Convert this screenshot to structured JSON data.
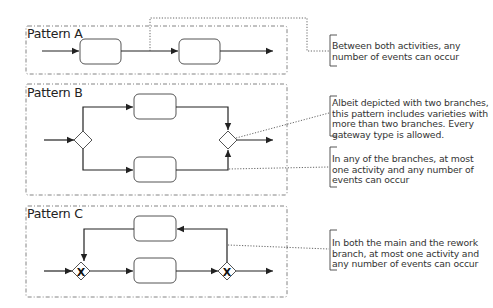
{
  "diagram": {
    "patterns": [
      {
        "label": "Pattern A",
        "elements": [
          "start-flow",
          "activity",
          "activity",
          "end-flow"
        ],
        "annotation": "Between both activities, any number of events can occur"
      },
      {
        "label": "Pattern B",
        "elements": [
          "start-flow",
          "split-gateway",
          "activity-upper",
          "activity-lower",
          "join-gateway",
          "end-flow"
        ],
        "annotations": [
          "Albeit depicted with two branches, this pattern includes varieties with more than two branches. Every gateway type is allowed.",
          "In any of the branches, at most one activity and any number of events can occur"
        ]
      },
      {
        "label": "Pattern C",
        "elements": [
          "start-flow",
          "xor-gateway-merge",
          "activity-main",
          "activity-rework",
          "xor-gateway-split",
          "end-flow"
        ],
        "gateway_marker": "X",
        "annotation": "In both the main and the rework branch, at most one activity and any number of events can occur"
      }
    ],
    "colors": {
      "line": "#333333",
      "box_border": "#555555",
      "dotted": "#555555",
      "text": "#222222"
    }
  }
}
